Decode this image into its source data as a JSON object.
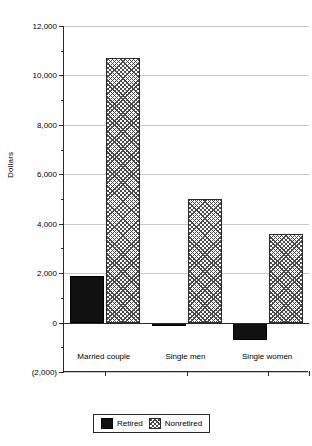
{
  "chart_data": {
    "type": "bar",
    "title": "",
    "subtitle": "",
    "xlabel": "",
    "ylabel": "Dollars",
    "categories": [
      "Married couple",
      "Single men",
      "Single women"
    ],
    "series": [
      {
        "name": "Retired",
        "values": [
          1900,
          -100,
          -700
        ]
      },
      {
        "name": "Nonretired",
        "values": [
          10700,
          5000,
          3600
        ]
      }
    ],
    "ylim": [
      -2000,
      12000
    ],
    "ytick_values": [
      -2000,
      0,
      2000,
      4000,
      6000,
      8000,
      10000,
      12000
    ],
    "ytick_labels": [
      "(2,000)",
      "0",
      "2,000",
      "4,000",
      "6,000",
      "8,000",
      "10,000",
      "12,000"
    ],
    "yminor_values": [
      -1000,
      1000,
      3000,
      5000,
      7000,
      9000,
      11000
    ],
    "grid": true,
    "grid_axis": "y",
    "legend": [
      "Retired",
      "Nonretired"
    ],
    "legend_position": "bottom-center",
    "colors": {
      "retired": "#111111",
      "nonretired_fill": "#ffffff",
      "nonretired_hatch": "#4a4a4a",
      "axis": "#2b2b2b",
      "grid": "#c9c9c9",
      "background": "#ffffff"
    }
  },
  "axis": {
    "y_label": "Dollars",
    "ticks": [
      {
        "label": "12,000"
      },
      {
        "label": "10,000"
      },
      {
        "label": "8,000"
      },
      {
        "label": "6,000"
      },
      {
        "label": "4,000"
      },
      {
        "label": "2,000"
      },
      {
        "label": "0"
      },
      {
        "label": "(2,000)"
      }
    ],
    "categories": [
      {
        "label": "Married couple"
      },
      {
        "label": "Single men"
      },
      {
        "label": "Single women"
      }
    ]
  },
  "legend": {
    "items": [
      {
        "label": "Retired",
        "pattern": "solid-black"
      },
      {
        "label": "Nonretired",
        "pattern": "crosshatch"
      }
    ]
  }
}
